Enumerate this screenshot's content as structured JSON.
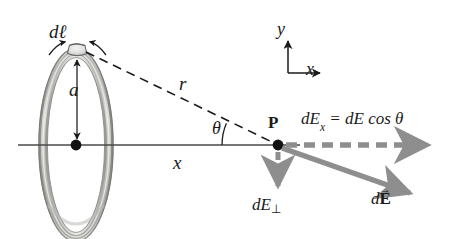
{
  "labels": {
    "dl": "dℓ",
    "radius": "a",
    "distance": "r",
    "theta": "θ",
    "point_p": "P",
    "axis_x": "x",
    "dex_equation_lhs": "dE",
    "dex_equation_sub": "x",
    "dex_equation_rhs": " = dE cos θ",
    "de_perp_main": "dE",
    "de_perp_sub": "⊥",
    "de_vector_d": "d",
    "de_vector_E": "E",
    "de_vector_arrow": "→"
  },
  "axes_indicator": {
    "y_label": "y",
    "x_label": "x"
  },
  "geometry": {
    "ring_center_x": 76,
    "ring_center_y": 145,
    "ring_radius_x": 33,
    "ring_radius_y": 92,
    "ring_tube_width": 7,
    "dl_element_x": 77,
    "dl_element_y": 50,
    "point_p_x": 278,
    "point_p_y": 145,
    "axis_left_x": 18,
    "axis_right_x": 300,
    "dex_arrow_end_x": 430,
    "de_arrow_end_x": 413,
    "de_arrow_end_y": 196,
    "de_perp_arrow_end_y": 190,
    "theta_arc_radius": 56
  },
  "colors": {
    "ink": "#1a1a1a",
    "vector_gray": "#8e8e8e",
    "vector_gray_dark": "#7c7c7c",
    "ring_outline": "#6f6f6f",
    "ring_fill_light": "#e8e8e6",
    "ring_fill_mid": "#bdbdba",
    "ring_fill_dark": "#9a9a97",
    "axis_line": "#4a4a4a",
    "background": "#ffffff"
  }
}
